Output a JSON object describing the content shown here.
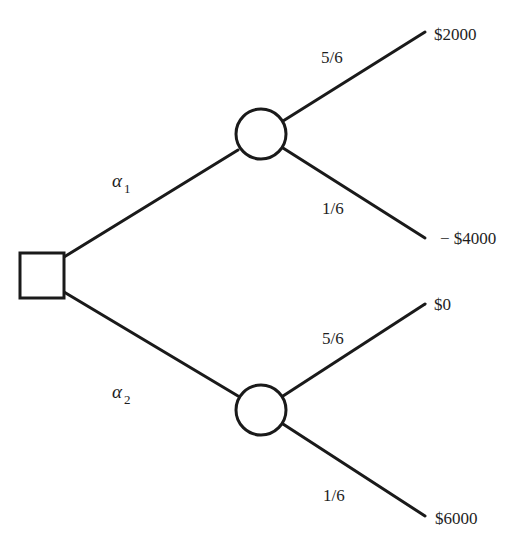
{
  "diagram": {
    "type": "decision-tree",
    "decision_node": {
      "shape": "square"
    },
    "alternatives": [
      {
        "symbol": "α",
        "subscript": "1",
        "chance_node": {
          "shape": "circle"
        },
        "outcomes": [
          {
            "probability": "5/6",
            "payoff": "$2000"
          },
          {
            "probability": "1/6",
            "payoff": "− $4000"
          }
        ]
      },
      {
        "symbol": "α",
        "subscript": "2",
        "chance_node": {
          "shape": "circle"
        },
        "outcomes": [
          {
            "probability": "5/6",
            "payoff": "$0"
          },
          {
            "probability": "1/6",
            "payoff": "$6000"
          }
        ]
      }
    ]
  },
  "colors": {
    "stroke": "#1a1a1a",
    "text": "#1e1e1e",
    "background": "#ffffff"
  }
}
